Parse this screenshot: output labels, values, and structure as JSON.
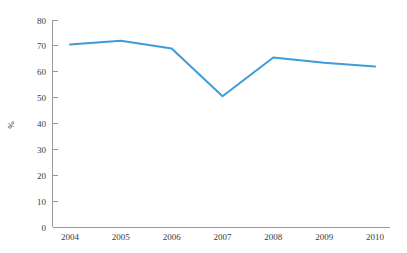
{
  "chart_data": {
    "type": "line",
    "title": "",
    "subtitle": "",
    "xlabel": "",
    "ylabel": "%",
    "categories": [
      "2004",
      "2005",
      "2006",
      "2007",
      "2008",
      "2009",
      "2010"
    ],
    "x": [
      2004,
      2005,
      2006,
      2007,
      2008,
      2009,
      2010
    ],
    "series": [
      {
        "name": "",
        "color": "#3f9bd9",
        "values": [
          70.5,
          72,
          69,
          50.5,
          65.5,
          63.5,
          62
        ]
      }
    ],
    "ylim": [
      0,
      80
    ],
    "yticks": [
      0,
      10,
      20,
      30,
      40,
      50,
      60,
      70,
      80
    ],
    "ytick_labels": [
      "0",
      "10",
      "20",
      "30",
      "40",
      "50",
      "60",
      "70",
      "80"
    ],
    "xtick_labels": [
      "2004",
      "2005",
      "2006",
      "2007",
      "2008",
      "2009",
      "2010"
    ],
    "grid": false,
    "legend": false,
    "legend_position": "none"
  },
  "axes": {
    "axis_color": "#9a9a9a",
    "label_color": "#3b3b3b"
  }
}
